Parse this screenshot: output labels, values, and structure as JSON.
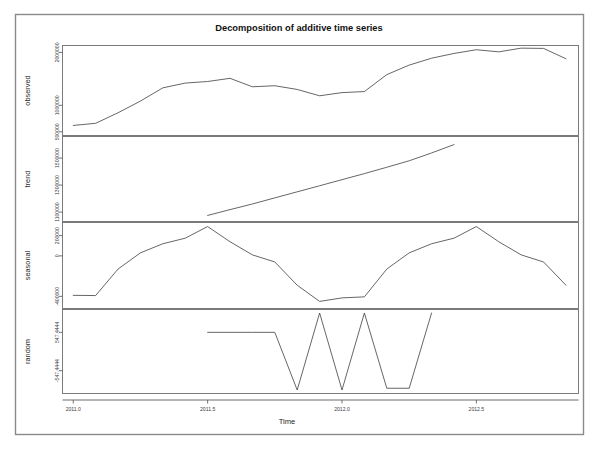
{
  "figure": {
    "title": "Decomposition of additive time series",
    "xlabel": "Time",
    "panels": [
      "observed",
      "trend",
      "seasonal",
      "random"
    ]
  },
  "labels": {
    "observed": "observed",
    "trend": "trend",
    "seasonal": "seasonal",
    "random": "random",
    "time": "Time"
  },
  "xaxis": {
    "ticks": [
      "2011.0",
      "2011.5",
      "2012.0",
      "2012.5"
    ],
    "tick_values": [
      2011.0,
      2011.5,
      2012.0,
      2012.5
    ],
    "range": [
      2010.96,
      2012.88
    ]
  },
  "yticks": {
    "observed": [
      "500000",
      "1000000",
      "2000000"
    ],
    "trend": [
      "1100000",
      "1300000",
      "1500000"
    ],
    "seasonal": [
      "-400000",
      "0",
      "200000"
    ],
    "random": [
      "-547.4444",
      "547.4444"
    ]
  },
  "chart_data": {
    "type": "line",
    "title": "Decomposition of additive time series",
    "subtitle": "",
    "xlabel": "Time",
    "ylabel": "",
    "grid": false,
    "legend": "none",
    "layout": "4 stacked panels sharing one x axis",
    "x": [
      2011.0,
      2011.0833,
      2011.1667,
      2011.25,
      2011.3333,
      2011.4167,
      2011.5,
      2011.5833,
      2011.6667,
      2011.75,
      2011.8333,
      2011.9167,
      2012.0,
      2012.0833,
      2012.1667,
      2012.25,
      2012.3333,
      2012.4167,
      2012.5,
      2012.5833,
      2012.6667,
      2012.75,
      2012.8333
    ],
    "panels": [
      {
        "name": "observed",
        "ylabel": "observed",
        "ytick_labels": [
          "500000",
          "1000000",
          "2000000"
        ],
        "ytick_values": [
          500000,
          1000000,
          2000000
        ],
        "ylim": [
          430000,
          2130000
        ],
        "values": [
          620000,
          660000,
          860000,
          1080000,
          1330000,
          1420000,
          1450000,
          1510000,
          1350000,
          1370000,
          1300000,
          1180000,
          1240000,
          1260000,
          1580000,
          1760000,
          1890000,
          1980000,
          2050000,
          2010000,
          2080000,
          2075000,
          1880000
        ]
      },
      {
        "name": "trend",
        "ylabel": "trend",
        "ytick_labels": [
          "1100000",
          "1300000",
          "1500000"
        ],
        "ytick_values": [
          1100000,
          1300000,
          1500000
        ],
        "ylim": [
          1030000,
          1660000
        ],
        "x_start": 2011.5,
        "x_end": 2012.4167,
        "values": [
          null,
          null,
          null,
          null,
          null,
          null,
          1075000,
          1118000,
          1160000,
          1205000,
          1250000,
          1295000,
          1340000,
          1385000,
          1432000,
          1480000,
          1538000,
          1600000,
          null,
          null,
          null,
          null,
          null
        ]
      },
      {
        "name": "seasonal",
        "ylabel": "seasonal",
        "ytick_labels": [
          "-400000",
          "0",
          "200000"
        ],
        "ytick_values": [
          -400000,
          0,
          200000
        ],
        "ylim": [
          -520000,
          330000
        ],
        "period": 12,
        "values": [
          -390000,
          -392000,
          -130000,
          30000,
          120000,
          175000,
          290000,
          140000,
          10000,
          -60000,
          -290000,
          -450000,
          -415000,
          -405000,
          -130000,
          30000,
          120000,
          175000,
          290000,
          140000,
          10000,
          -60000,
          -290000
        ]
      },
      {
        "name": "random",
        "ylabel": "random",
        "ytick_labels": [
          "-547.4444",
          "547.4444"
        ],
        "ytick_values": [
          -547.4444,
          547.4444
        ],
        "ylim": [
          -1200,
          1200
        ],
        "x_start": 2011.5,
        "x_end": 2012.4167,
        "values": [
          null,
          null,
          null,
          null,
          null,
          null,
          547.4444,
          547.4444,
          547.4444,
          547.4444,
          -1100,
          1100,
          -1100,
          1100,
          -1050,
          -1050,
          1100,
          null,
          null,
          null,
          null,
          null,
          null
        ]
      }
    ]
  }
}
